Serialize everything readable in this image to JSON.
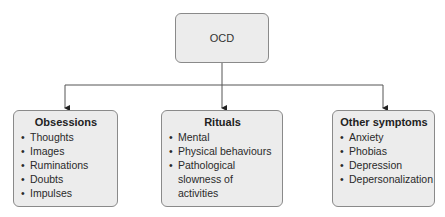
{
  "root": {
    "label": "OCD"
  },
  "children": [
    {
      "title": "Obsessions",
      "items": [
        "Thoughts",
        "Images",
        "Ruminations",
        "Doubts",
        "Impulses"
      ]
    },
    {
      "title": "Rituals",
      "items": [
        "Mental",
        "Physical behaviours",
        "Pathological slowness of activities"
      ]
    },
    {
      "title": "Other symptoms",
      "items": [
        "Anxiety",
        "Phobias",
        "Depression",
        "Depersonalization"
      ]
    }
  ],
  "colors": {
    "box_fill": "#ececec",
    "box_border": "#8a8a8a",
    "connector": "#555555"
  }
}
